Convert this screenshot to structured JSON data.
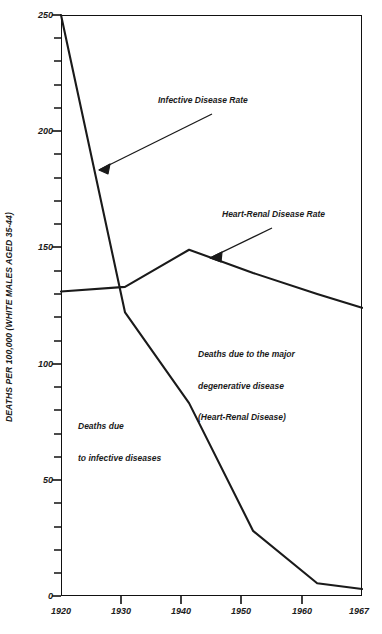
{
  "chart_data": {
    "type": "line",
    "title": "",
    "subtitle": "",
    "xlabel": "",
    "ylabel": "DEATHS PER 100,000 (WHITE MALES AGED 35-44)",
    "x": [
      1920,
      1930,
      1940,
      1950,
      1960,
      1967
    ],
    "xtick_labels": [
      "1920",
      "1930",
      "1940",
      "1950",
      "1960",
      "1967"
    ],
    "ytick_labels": [
      "250",
      "200",
      "150",
      "100",
      "50",
      "0"
    ],
    "ytick_values": [
      250,
      200,
      150,
      100,
      50,
      0
    ],
    "ylim": [
      0,
      250
    ],
    "xlim": [
      1920,
      1967
    ],
    "y_minor_tick_step": 10,
    "grid": false,
    "legend": "none",
    "series": [
      {
        "name": "Infective Disease Rate",
        "values": [
          250,
          122,
          83,
          28,
          5.5,
          3
        ]
      },
      {
        "name": "Heart-Renal Disease Rate",
        "values": [
          131,
          133,
          149,
          139,
          130,
          124
        ]
      }
    ],
    "annotations": [
      {
        "id": "infective-rate",
        "text": "Infective Disease Rate",
        "arrow_from": [
          1940.5,
          214
        ],
        "arrow_to": [
          1925.7,
          194
        ]
      },
      {
        "id": "heart-renal-rate",
        "text": "Heart-Renal Disease Rate",
        "arrow_from": [
          1952.5,
          158
        ],
        "arrow_to": [
          1941.2,
          145
        ]
      },
      {
        "id": "degenerative-note",
        "line1": "Deaths due to the major",
        "line2": "degenerative disease",
        "line3": "(Heart-Renal Disease)"
      },
      {
        "id": "infective-note",
        "line1": "Deaths due",
        "line2": "to infective diseases"
      }
    ],
    "colors": {
      "line": "#1a1a1a",
      "axis": "#111111",
      "background": "#ffffff"
    }
  }
}
